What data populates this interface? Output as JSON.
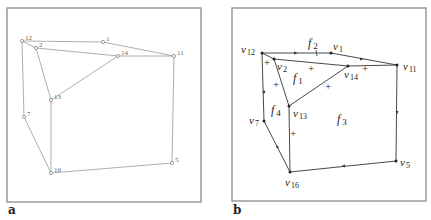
{
  "panels": [
    {
      "label": "a",
      "frame": {
        "x": 7,
        "y": 8,
        "w": 194,
        "h": 194
      },
      "vertices": [
        {
          "id": "12",
          "label": "12",
          "x": 22,
          "y": 41
        },
        {
          "id": "2",
          "label": "2",
          "x": 36,
          "y": 48
        },
        {
          "id": "1",
          "label": "1",
          "x": 103,
          "y": 42
        },
        {
          "id": "14",
          "label": "14",
          "x": 118,
          "y": 56
        },
        {
          "id": "11",
          "label": "11",
          "x": 174,
          "y": 56
        },
        {
          "id": "13",
          "label": "13",
          "x": 51,
          "y": 100
        },
        {
          "id": "7",
          "label": "7",
          "x": 24,
          "y": 117
        },
        {
          "id": "16",
          "label": "16",
          "x": 51,
          "y": 173
        },
        {
          "id": "5",
          "label": "5",
          "x": 172,
          "y": 163
        }
      ],
      "edges": [
        [
          "12",
          "1"
        ],
        [
          "1",
          "11"
        ],
        [
          "12",
          "2"
        ],
        [
          "2",
          "14"
        ],
        [
          "14",
          "11"
        ],
        [
          "2",
          "13"
        ],
        [
          "13",
          "14"
        ],
        [
          "12",
          "7"
        ],
        [
          "7",
          "16"
        ],
        [
          "13",
          "16"
        ],
        [
          "16",
          "5"
        ],
        [
          "5",
          "11"
        ]
      ]
    },
    {
      "label": "b",
      "frame": {
        "x": 232,
        "y": 8,
        "w": 194,
        "h": 193
      },
      "vertices": [
        {
          "id": "v12",
          "label": "v",
          "sub": "12",
          "x": 262,
          "y": 53,
          "lx": 241,
          "ly": 53
        },
        {
          "id": "v2",
          "label": "v",
          "sub": "2",
          "x": 274,
          "y": 59,
          "lx": 277,
          "ly": 70
        },
        {
          "id": "v1",
          "label": "v",
          "sub": "1",
          "x": 331,
          "y": 53,
          "lx": 333,
          "ly": 50
        },
        {
          "id": "v14",
          "label": "v",
          "sub": "14",
          "x": 348,
          "y": 66,
          "lx": 344,
          "ly": 78
        },
        {
          "id": "v11",
          "label": "v",
          "sub": "11",
          "x": 397,
          "y": 65,
          "lx": 403,
          "ly": 70
        },
        {
          "id": "v13",
          "label": "v",
          "sub": "13",
          "x": 289,
          "y": 106,
          "lx": 293,
          "ly": 117
        },
        {
          "id": "v7",
          "label": "v",
          "sub": "7",
          "x": 264,
          "y": 121,
          "lx": 249,
          "ly": 124
        },
        {
          "id": "v16",
          "label": "v",
          "sub": "16",
          "x": 290,
          "y": 172,
          "lx": 285,
          "ly": 186
        },
        {
          "id": "v5",
          "label": "v",
          "sub": "5",
          "x": 396,
          "y": 161,
          "lx": 400,
          "ly": 166
        }
      ],
      "edges": [
        [
          "v12",
          "v1"
        ],
        [
          "v1",
          "v11"
        ],
        [
          "v12",
          "v2"
        ],
        [
          "v2",
          "v14"
        ],
        [
          "v14",
          "v11"
        ],
        [
          "v2",
          "v13"
        ],
        [
          "v13",
          "v14"
        ],
        [
          "v12",
          "v7"
        ],
        [
          "v7",
          "v16"
        ],
        [
          "v13",
          "v16"
        ],
        [
          "v16",
          "v5"
        ],
        [
          "v5",
          "v11"
        ]
      ],
      "faces": [
        {
          "label": "f",
          "sub": "1",
          "x": 293,
          "y": 82
        },
        {
          "label": "f",
          "sub": "2",
          "x": 308,
          "y": 47
        },
        {
          "label": "f",
          "sub": "3",
          "x": 337,
          "y": 123
        },
        {
          "label": "f",
          "sub": "4",
          "x": 271,
          "y": 114
        }
      ],
      "plus_marks": [
        {
          "text": "+",
          "x": 267,
          "y": 66
        },
        {
          "text": "+",
          "x": 311,
          "y": 72
        },
        {
          "text": "+",
          "x": 365,
          "y": 72
        },
        {
          "text": "+",
          "x": 276,
          "y": 88
        },
        {
          "text": "+",
          "x": 328,
          "y": 90
        },
        {
          "text": "+",
          "x": 293,
          "y": 137
        }
      ],
      "arrows": [
        {
          "x": 296,
          "y": 53,
          "dir": "right"
        },
        {
          "x": 362,
          "y": 59,
          "dir": "right"
        },
        {
          "x": 397,
          "y": 113,
          "dir": "down"
        },
        {
          "x": 343,
          "y": 166,
          "dir": "left"
        },
        {
          "x": 264,
          "y": 91,
          "dir": "up"
        },
        {
          "x": 277,
          "y": 146,
          "dir": "up-left"
        }
      ],
      "tick": {
        "x": 316,
        "y": 53
      }
    }
  ],
  "colors": {
    "frame": "#8a8a8a",
    "edge_a": "#9a9a9a",
    "edge_b": "#333333",
    "text": "#222222"
  }
}
